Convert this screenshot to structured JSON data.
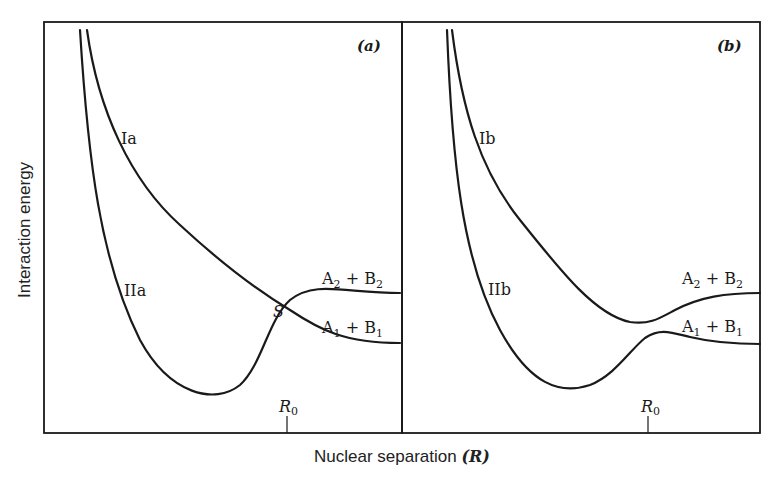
{
  "figure": {
    "ylabel": "Interaction energy",
    "xlabel_text": "Nuclear separation ",
    "xlabel_symbol": "(R)",
    "panels": [
      {
        "id": "a",
        "label": "(a)",
        "upper_curve_label": "Ia",
        "lower_curve_label": "IIa",
        "crossing_label": "S",
        "r0_label": "R",
        "r0_sub": "0",
        "asymptote_upper": {
          "A": "A",
          "A_sub": "2",
          "plus": " + ",
          "B": "B",
          "B_sub": "2"
        },
        "asymptote_lower": {
          "A": "A",
          "A_sub": "1",
          "plus": " + ",
          "B": "B",
          "B_sub": "1"
        }
      },
      {
        "id": "b",
        "label": "(b)",
        "upper_curve_label": "Ib",
        "lower_curve_label": "IIb",
        "r0_label": "R",
        "r0_sub": "0",
        "asymptote_upper": {
          "A": "A",
          "A_sub": "2",
          "plus": " + ",
          "B": "B",
          "B_sub": "2"
        },
        "asymptote_lower": {
          "A": "A",
          "A_sub": "1",
          "plus": " + ",
          "B": "B",
          "B_sub": "1"
        }
      }
    ]
  }
}
